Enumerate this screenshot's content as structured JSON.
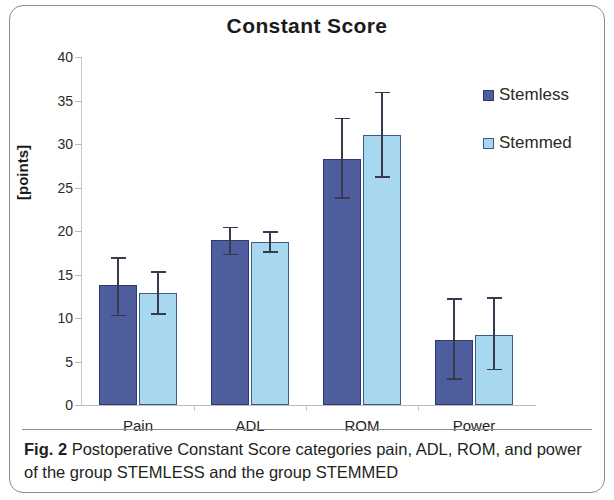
{
  "figure": {
    "caption_label": "Fig. 2",
    "caption_text": "Postoperative Constant Score categories pain, ADL, ROM, and power of the group STEMLESS and the group STEMMED"
  },
  "legend": {
    "items": [
      {
        "label": "Stemless",
        "color": "#4e5d9e",
        "swatch": "dark"
      },
      {
        "label": "Stemmed",
        "color": "#a8d8f0",
        "swatch": "light"
      }
    ]
  },
  "chart_data": {
    "type": "bar",
    "title": "Constant Score",
    "xlabel": "",
    "ylabel": "[points]",
    "ylim": [
      0,
      40
    ],
    "ytick_labels": [
      "0",
      "5",
      "10",
      "15",
      "20",
      "25",
      "30",
      "35",
      "40"
    ],
    "yticks": [
      0,
      5,
      10,
      15,
      20,
      25,
      30,
      35,
      40
    ],
    "grid": false,
    "legend_position": "right",
    "categories": [
      "Pain",
      "ADL",
      "ROM",
      "Power"
    ],
    "series": [
      {
        "name": "Stemless",
        "color": "#4e5d9e",
        "values": [
          13.8,
          19.0,
          28.3,
          7.5
        ],
        "error_low": [
          10.2,
          17.2,
          23.7,
          2.9
        ],
        "error_high": [
          17.0,
          20.5,
          33.0,
          12.3
        ]
      },
      {
        "name": "Stemmed",
        "color": "#a8d8f0",
        "values": [
          12.9,
          18.7,
          31.0,
          8.0
        ],
        "error_low": [
          10.4,
          17.5,
          26.1,
          4.0
        ],
        "error_high": [
          15.4,
          20.0,
          36.0,
          12.4
        ]
      }
    ]
  }
}
